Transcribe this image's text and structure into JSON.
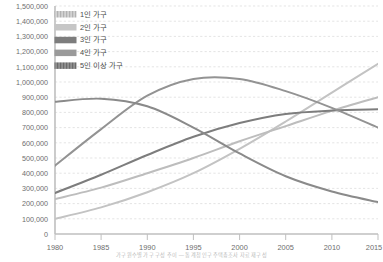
{
  "chart_data": {
    "type": "line",
    "title": "",
    "xlabel": "",
    "ylabel": "",
    "x": [
      1980,
      1985,
      1990,
      1995,
      2000,
      2005,
      2010,
      2015
    ],
    "xlim": [
      1980,
      2015
    ],
    "ylim": [
      0,
      1500000
    ],
    "ytick_labels": [
      "1,500,000",
      "1,400,000",
      "1,300,000",
      "1,200,000",
      "1,100,000",
      "1,000,000",
      "900,000",
      "800,000",
      "700,000",
      "600,000",
      "500,000",
      "400,000",
      "300,000",
      "200,000",
      "100,000",
      "0"
    ],
    "ytick_values": [
      1500000,
      1400000,
      1300000,
      1200000,
      1100000,
      1000000,
      900000,
      800000,
      700000,
      600000,
      500000,
      400000,
      300000,
      200000,
      100000,
      0
    ],
    "xtick_labels": [
      "1980",
      "1985",
      "1990",
      "1995",
      "2000",
      "2005",
      "2010",
      "2015"
    ],
    "grid": true,
    "grid_style": "dashed-horizontal",
    "legend_position": "top-left",
    "series": [
      {
        "name": "1인 가구",
        "color": "#c3c3c3",
        "swatch": "hatched-light",
        "values": [
          100000,
          175000,
          275000,
          400000,
          560000,
          740000,
          930000,
          1120000
        ]
      },
      {
        "name": "2인 가구",
        "color": "#bdbdbd",
        "swatch": "solid-light",
        "values": [
          230000,
          305000,
          400000,
          500000,
          610000,
          710000,
          810000,
          900000
        ]
      },
      {
        "name": "3인 가구",
        "color": "#7d7d7d",
        "swatch": "solid-dark",
        "values": [
          270000,
          390000,
          520000,
          640000,
          730000,
          790000,
          812000,
          820000
        ]
      },
      {
        "name": "4인 가구",
        "color": "#939393",
        "swatch": "solid-medium",
        "values": [
          450000,
          690000,
          910000,
          1020000,
          1020000,
          940000,
          830000,
          700000
        ]
      },
      {
        "name": "5인 이상 가구",
        "color": "#8a8a8a",
        "swatch": "hatched-dark",
        "values": [
          870000,
          890000,
          840000,
          700000,
          530000,
          380000,
          280000,
          210000
        ]
      }
    ]
  },
  "caption": {
    "text": "가구원수별 가구 구성 추이 ― 통계청 인구주택총조사 자료 재구성"
  }
}
